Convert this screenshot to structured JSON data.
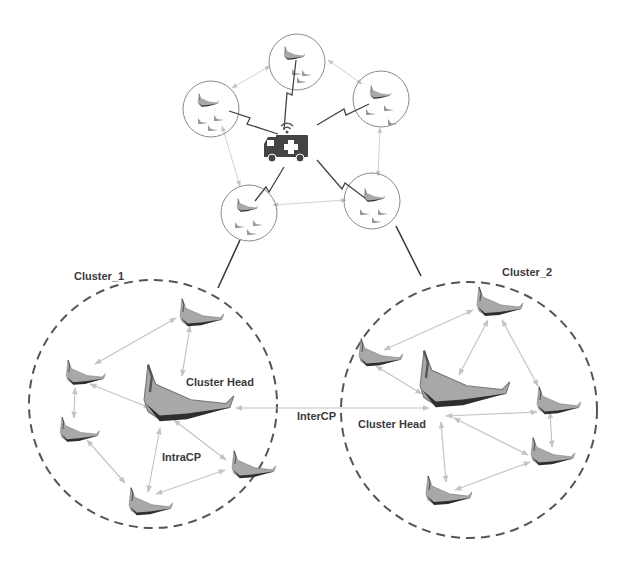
{
  "labels": {
    "cluster1": "Cluster_1",
    "cluster2": "Cluster_2",
    "cluster1_head": "Cluster Head",
    "cluster2_head": "Cluster Head",
    "intra": "IntraCP",
    "inter": "InterCP"
  },
  "icons": {
    "center": "ambulance-icon",
    "uav": "flying-wing-uav-icon",
    "link": "wireless-lightning-link"
  },
  "colors": {
    "drone_fill": "#9a9a9a",
    "drone_dark": "#2e2e2e",
    "arrow": "#c4c4c4",
    "dashed_circle": "#555555",
    "small_circle": "#8a8a8a",
    "ambulance": "#444444",
    "label": "#3a3a3a"
  },
  "top_swarm": {
    "hub": "ambulance",
    "groups": 5,
    "drones_per_group": 4
  },
  "clusters": [
    {
      "name": "Cluster_1",
      "members": 5,
      "has_head": true
    },
    {
      "name": "Cluster_2",
      "members": 5,
      "has_head": true
    }
  ]
}
